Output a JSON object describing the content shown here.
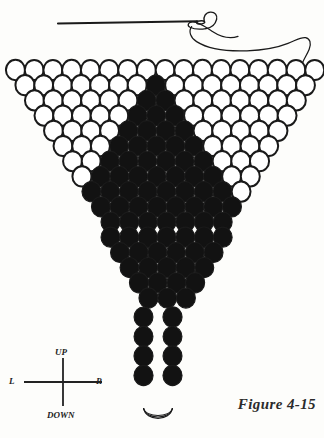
{
  "figure": {
    "caption": "Figure 4-15"
  },
  "legend": {
    "up": "UP",
    "down": "DOWN",
    "left": "L",
    "right": "R"
  },
  "colors": {
    "outline": "#1a1a1a",
    "bead_fill_empty": "#ffffff",
    "bead_fill_solid": "#121212",
    "thread": "#1a1a1a",
    "paper": "#fdfdfb",
    "text": "#242424"
  },
  "needle": {
    "name": "needle-and-thread",
    "shaft_start_x": 58,
    "shaft_end_x": 200,
    "shaft_y": 22,
    "eye_x": 203,
    "eye_y": 22
  },
  "chart_data": {
    "type": "table",
    "bead_diameter": 19,
    "row_pitch": 15.2,
    "first_row_y": 70,
    "first_row_left_x": 6,
    "rows": [
      {
        "index": 1,
        "count": 17,
        "left_x": 6.0,
        "y": 70.0,
        "beads": [
          0,
          0,
          0,
          0,
          0,
          0,
          0,
          0,
          0,
          0,
          0,
          0,
          0,
          0,
          0,
          0,
          0
        ]
      },
      {
        "index": 2,
        "count": 16,
        "left_x": 15.5,
        "y": 85.2,
        "beads": [
          0,
          0,
          0,
          0,
          0,
          0,
          0,
          1,
          0,
          0,
          0,
          0,
          0,
          0,
          0,
          0
        ]
      },
      {
        "index": 3,
        "count": 15,
        "left_x": 25.0,
        "y": 100.4,
        "beads": [
          0,
          0,
          0,
          0,
          0,
          0,
          1,
          1,
          0,
          0,
          0,
          0,
          0,
          0,
          0
        ]
      },
      {
        "index": 4,
        "count": 14,
        "left_x": 34.5,
        "y": 115.6,
        "beads": [
          0,
          0,
          0,
          0,
          0,
          1,
          1,
          1,
          0,
          0,
          0,
          0,
          0,
          0
        ]
      },
      {
        "index": 5,
        "count": 13,
        "left_x": 44.0,
        "y": 130.8,
        "beads": [
          0,
          0,
          0,
          0,
          1,
          1,
          1,
          1,
          0,
          0,
          0,
          0,
          0
        ]
      },
      {
        "index": 6,
        "count": 12,
        "left_x": 53.5,
        "y": 146.0,
        "beads": [
          0,
          0,
          0,
          1,
          1,
          1,
          1,
          1,
          0,
          0,
          0,
          0
        ]
      },
      {
        "index": 7,
        "count": 11,
        "left_x": 63.0,
        "y": 161.2,
        "beads": [
          0,
          0,
          1,
          1,
          1,
          1,
          1,
          1,
          0,
          0,
          0
        ]
      },
      {
        "index": 8,
        "count": 10,
        "left_x": 72.5,
        "y": 176.4,
        "beads": [
          0,
          1,
          1,
          1,
          1,
          1,
          1,
          1,
          0,
          0
        ]
      },
      {
        "index": 9,
        "count": 9,
        "left_x": 82.0,
        "y": 191.6,
        "beads": [
          1,
          1,
          1,
          1,
          1,
          1,
          1,
          1,
          0
        ]
      },
      {
        "index": 10,
        "count": 8,
        "left_x": 91.5,
        "y": 206.8,
        "beads": [
          1,
          1,
          1,
          1,
          1,
          1,
          1,
          1
        ]
      },
      {
        "index": 11,
        "count": 7,
        "left_x": 101.0,
        "y": 222.0,
        "beads": [
          1,
          1,
          1,
          1,
          1,
          1,
          1
        ]
      },
      {
        "index": 12,
        "count": 7,
        "left_x": 101.0,
        "y": 237.2,
        "beads": [
          1,
          1,
          1,
          1,
          1,
          1,
          1
        ]
      },
      {
        "index": 13,
        "count": 6,
        "left_x": 110.5,
        "y": 252.4,
        "beads": [
          1,
          1,
          1,
          1,
          1,
          1
        ]
      },
      {
        "index": 14,
        "count": 5,
        "left_x": 120.0,
        "y": 267.6,
        "beads": [
          1,
          1,
          1,
          1,
          1
        ]
      },
      {
        "index": 15,
        "count": 4,
        "left_x": 129.5,
        "y": 282.8,
        "beads": [
          1,
          1,
          1,
          1
        ]
      },
      {
        "index": 16,
        "count": 3,
        "left_x": 139.0,
        "y": 298.0,
        "beads": [
          1,
          1,
          1
        ]
      }
    ],
    "fringe": {
      "columns": [
        {
          "x": 143.5,
          "beads": [
            1,
            1,
            1,
            1
          ],
          "top_y": 317,
          "pitch": 19.5
        },
        {
          "x": 172.5,
          "beads": [
            1,
            1,
            1,
            1
          ],
          "top_y": 317,
          "pitch": 19.5
        }
      ],
      "loop_y": 412
    }
  }
}
